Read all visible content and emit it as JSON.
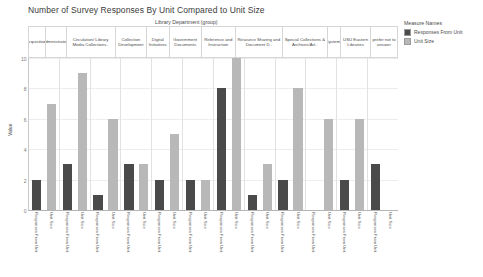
{
  "chart_data": {
    "type": "bar",
    "title": "Number of Survey Responses By Unit Compared to Unit Size",
    "xlabel": "",
    "ylabel": "Value",
    "ylim": [
      0,
      10
    ],
    "yticks": [
      "10",
      "8",
      "6",
      "4",
      "2",
      "0"
    ],
    "grid": true,
    "legend_position": "right",
    "legend_title": "Measure Names",
    "group_axis_title": "Library Department (group)",
    "categories": [
      "Acquisitions",
      "Administration",
      "Circulation/ Library Media Collections..",
      "Collection Development",
      "Digital Initiatives",
      "Government Documents",
      "Reference and Instruction",
      "Resource Sharing and Document D..",
      "Special Collections & Archives/Art..",
      "Systems",
      "USU Eastern Libraries",
      "prefer not to answer"
    ],
    "measure_labels": [
      "Responses From Unit",
      "Unit Size"
    ],
    "series": [
      {
        "name": "Responses From Unit",
        "color": "#4a4a4a",
        "values": [
          2,
          3,
          1,
          3,
          2,
          2,
          8,
          1,
          2,
          0,
          2,
          3
        ]
      },
      {
        "name": "Unit Size",
        "color": "#b8b8b8",
        "values": [
          7,
          9,
          6,
          3,
          5,
          2,
          10,
          3,
          8,
          6,
          6,
          0
        ]
      }
    ]
  },
  "legend": {
    "title": "Measure Names",
    "entries": [
      {
        "label": "Responses From Unit",
        "color": "#4a4a4a"
      },
      {
        "label": "Unit Size",
        "color": "#b8b8b8"
      }
    ]
  }
}
